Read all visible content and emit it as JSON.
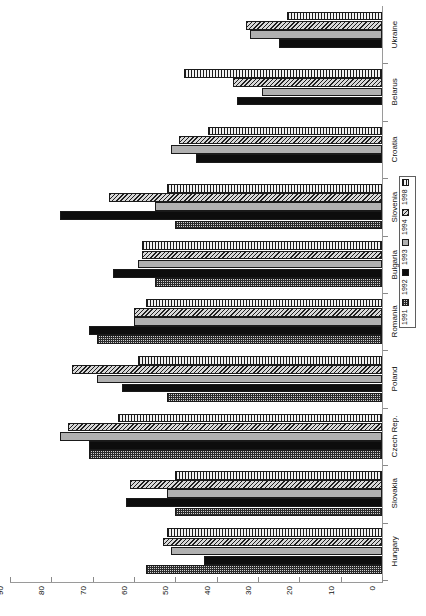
{
  "chart_data": {
    "type": "bar",
    "orientation": "rotated-vertical-bar",
    "title": "",
    "xlabel": "",
    "ylabel": "",
    "ylim": [
      0,
      90
    ],
    "grid": false,
    "legend_position": "right-middle",
    "categories": [
      "Hungary",
      "Slovakia",
      "Czech Rep.",
      "Poland",
      "Romania",
      "Bulgaria",
      "Slovenia",
      "Croatia",
      "Belarus",
      "Ukraine"
    ],
    "tick_labels": [
      "90",
      "80",
      "70",
      "60",
      "50",
      "40",
      "30",
      "20",
      "10",
      "0"
    ],
    "tick_values": [
      90,
      80,
      70,
      60,
      50,
      40,
      30,
      20,
      10,
      0
    ],
    "series": [
      {
        "name": "1991",
        "values": [
          57,
          50,
          71,
          52,
          69,
          55,
          50,
          0,
          0,
          0
        ]
      },
      {
        "name": "1992",
        "values": [
          43,
          62,
          71,
          63,
          71,
          65,
          78,
          45,
          35,
          25
        ]
      },
      {
        "name": "1993",
        "values": [
          51,
          52,
          78,
          69,
          60,
          59,
          55,
          51,
          29,
          32
        ]
      },
      {
        "name": "1994",
        "values": [
          53,
          61,
          76,
          75,
          60,
          58,
          66,
          49,
          36,
          33
        ]
      },
      {
        "name": "1998",
        "values": [
          52,
          50,
          64,
          59,
          57,
          58,
          52,
          42,
          48,
          23
        ]
      }
    ]
  },
  "legend": {
    "entries": [
      {
        "label": "1998",
        "pattern": "vertical-stripes"
      },
      {
        "label": "1994",
        "pattern": "diagonal-hatch"
      },
      {
        "label": "1993",
        "pattern": "solid-gray"
      },
      {
        "label": "1992",
        "pattern": "solid-black"
      },
      {
        "label": "1991",
        "pattern": "checker"
      }
    ]
  },
  "axis": {
    "value_axis_max_label": "90",
    "value_axis_min_label": "0"
  }
}
